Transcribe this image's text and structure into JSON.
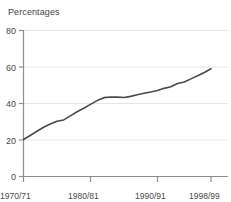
{
  "chart_data": {
    "type": "line",
    "title": "",
    "subtitle": "Percentages",
    "xlabel": "",
    "ylabel": "",
    "ylim": [
      0,
      80
    ],
    "yticks": [
      0,
      20,
      40,
      60,
      80
    ],
    "ytick_labels": [
      "0",
      "20",
      "40",
      "60",
      "80"
    ],
    "xtick_labels": [
      "1970/71",
      "1980/81",
      "1990/91",
      "1998/99"
    ],
    "xticks": [
      1970,
      1980,
      1990,
      1998
    ],
    "xlim": [
      1970,
      1998
    ],
    "grid": true,
    "legend": "none",
    "line_color": "#4a4a4a",
    "grid_color": "#e3e3e3",
    "axis_color": "#8c8c8c",
    "series": [
      {
        "name": "Percentages",
        "x": [
          1970,
          1971,
          1972,
          1973,
          1974,
          1975,
          1976,
          1977,
          1978,
          1979,
          1980,
          1981,
          1982,
          1983,
          1984,
          1985,
          1986,
          1987,
          1988,
          1989,
          1990,
          1991,
          1992,
          1993,
          1994,
          1995,
          1996,
          1997,
          1998
        ],
        "values": [
          20.3,
          22.5,
          24.8,
          27.0,
          28.8,
          30.3,
          31.0,
          33.2,
          35.5,
          37.4,
          39.5,
          41.6,
          43.2,
          43.6,
          43.5,
          43.3,
          43.9,
          44.8,
          45.6,
          46.3,
          47.1,
          48.3,
          49.2,
          51.0,
          51.8,
          53.5,
          55.2,
          57.0,
          59.0
        ]
      }
    ]
  }
}
